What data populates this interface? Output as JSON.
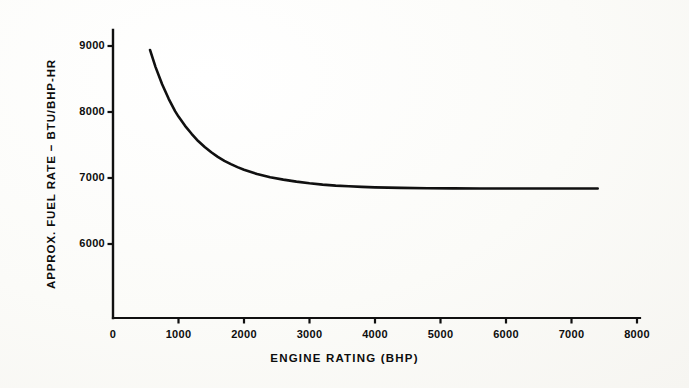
{
  "figure": {
    "background_color": "#fcfcfa",
    "ink_color": "#101010"
  },
  "chart_data": {
    "type": "line",
    "title": "",
    "subtitle": "",
    "xlabel": "ENGINE  RATING  (BHP)",
    "ylabel": "APPROX.  FUEL  RATE  −  BTU/BHP-HR",
    "xlim": [
      0,
      8000
    ],
    "ylim": [
      5350,
      9250
    ],
    "xticks": [
      0,
      1000,
      2000,
      3000,
      4000,
      5000,
      6000,
      7000,
      8000
    ],
    "xtick_labels": [
      "0",
      "1000",
      "2000",
      "3000",
      "4000",
      "5000",
      "6000",
      "7000",
      "8000"
    ],
    "yticks": [
      6000,
      7000,
      8000,
      9000
    ],
    "ytick_labels": [
      "6000",
      "7000",
      "8000",
      "9000"
    ],
    "grid": false,
    "legend": null,
    "legend_position": "none",
    "annotations": [],
    "series": [
      {
        "name": "Approx. fuel rate",
        "line_color": "#101010",
        "line_width": 2.6,
        "x": [
          565,
          650,
          750,
          850,
          950,
          1000,
          1100,
          1200,
          1300,
          1400,
          1500,
          1600,
          1700,
          1800,
          1900,
          2000,
          2200,
          2400,
          2600,
          2800,
          3000,
          3200,
          3400,
          3600,
          3800,
          4000,
          4400,
          4800,
          5200,
          5600,
          6000,
          6400,
          6800,
          7100,
          7400
        ],
        "y": [
          8940,
          8680,
          8420,
          8200,
          8010,
          7930,
          7790,
          7670,
          7560,
          7470,
          7390,
          7320,
          7260,
          7210,
          7165,
          7125,
          7060,
          7010,
          6975,
          6945,
          6920,
          6900,
          6885,
          6875,
          6865,
          6858,
          6850,
          6845,
          6843,
          6842,
          6841,
          6840,
          6840,
          6840,
          6840
        ]
      }
    ]
  },
  "axes_geometry": {
    "x_axis_y_px": 318,
    "y_axis_x_px": 113,
    "x0_px": 113,
    "x_per_unit_px": 0.0655,
    "y9000_px": 46,
    "y_per_unit_px": 0.066
  }
}
